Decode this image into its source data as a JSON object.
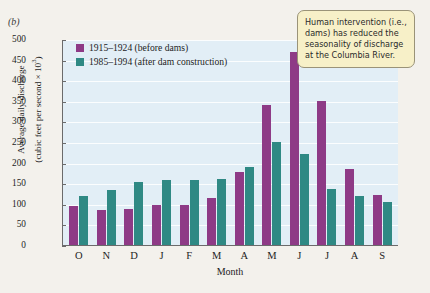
{
  "panel_label": "(b)",
  "callout": {
    "text": "Human intervention (i.e., dams) has reduced the seasonality of discharge at the Columbia River."
  },
  "legend": {
    "items": [
      {
        "label": "1915–1924 (before dams)",
        "color": "#8e3a86"
      },
      {
        "label": "1985–1994 (after dam construction)",
        "color": "#2f8984"
      }
    ]
  },
  "chart_data": {
    "type": "bar",
    "title": "",
    "xlabel": "Month",
    "ylabel": "Average daily discharge (cubic feet per second × 10³)",
    "ylabel_line1": "Average daily discharge",
    "ylabel_line2": "(cubic feet per second × 10",
    "ylabel_exponent": "3",
    "ylim": [
      0,
      500
    ],
    "ytick_step": 50,
    "yticks": [
      500,
      450,
      400,
      350,
      300,
      250,
      200,
      150,
      100,
      50,
      0
    ],
    "grid": true,
    "legend_position": "top-left-inside",
    "categories": [
      "O",
      "N",
      "D",
      "J",
      "F",
      "M",
      "A",
      "M",
      "J",
      "J",
      "A",
      "S"
    ],
    "series": [
      {
        "name": "1915–1924 (before dams)",
        "color": "#8e3a86",
        "values": [
          95,
          85,
          88,
          98,
          98,
          113,
          178,
          340,
          468,
          350,
          185,
          122
        ]
      },
      {
        "name": "1985–1994 (after dam construction)",
        "color": "#2f8984",
        "values": [
          118,
          133,
          152,
          158,
          157,
          160,
          190,
          250,
          220,
          135,
          118,
          105
        ]
      }
    ]
  }
}
